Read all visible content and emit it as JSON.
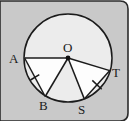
{
  "figure": {
    "name": "circle-with-congruent-chords",
    "background_color": "#c9c9c9",
    "panel_color": "#c9c9c9",
    "border_color": "#2b2b2b",
    "circle_fill": "#ececec",
    "triangle_fill": "#fdfdfd",
    "stroke_color": "#1b1b1b",
    "outside_color": "#ffffff",
    "circle": {
      "center_x": 68,
      "center_y": 58,
      "radius": 44,
      "center_dot_radius": 2.4
    },
    "points": [
      {
        "id": "A",
        "label": "A",
        "x": 24.6,
        "y": 58.0,
        "label_x": 9,
        "label_y": 52
      },
      {
        "id": "O",
        "label": "O",
        "x": 68.0,
        "y": 58.0,
        "label_x": 63,
        "label_y": 41
      },
      {
        "id": "T",
        "label": "T",
        "x": 109.8,
        "y": 70.6,
        "label_x": 112,
        "label_y": 66
      },
      {
        "id": "B",
        "label": "B",
        "x": 45.2,
        "y": 96.5,
        "label_x": 39,
        "label_y": 99
      },
      {
        "id": "S",
        "label": "S",
        "x": 84.3,
        "y": 98.9,
        "label_x": 78,
        "label_y": 103
      }
    ],
    "radii": [
      {
        "name": "radius-OA",
        "from": "O",
        "to": "A"
      },
      {
        "name": "radius-OB",
        "from": "O",
        "to": "B"
      },
      {
        "name": "radius-OS",
        "from": "O",
        "to": "S"
      },
      {
        "name": "radius-OT",
        "from": "O",
        "to": "T"
      }
    ],
    "chords": [
      {
        "name": "chord-AB",
        "from": "A",
        "to": "B",
        "tick": true
      },
      {
        "name": "chord-ST",
        "from": "S",
        "to": "T",
        "tick": true
      }
    ],
    "tick_marks": [
      {
        "name": "tick-chord-AB",
        "x": 34.9,
        "y": 77.3,
        "angle": 59,
        "length": 9
      },
      {
        "name": "tick-chord-ST",
        "x": 97.0,
        "y": 84.8,
        "angle": -56,
        "length": 9
      }
    ]
  }
}
